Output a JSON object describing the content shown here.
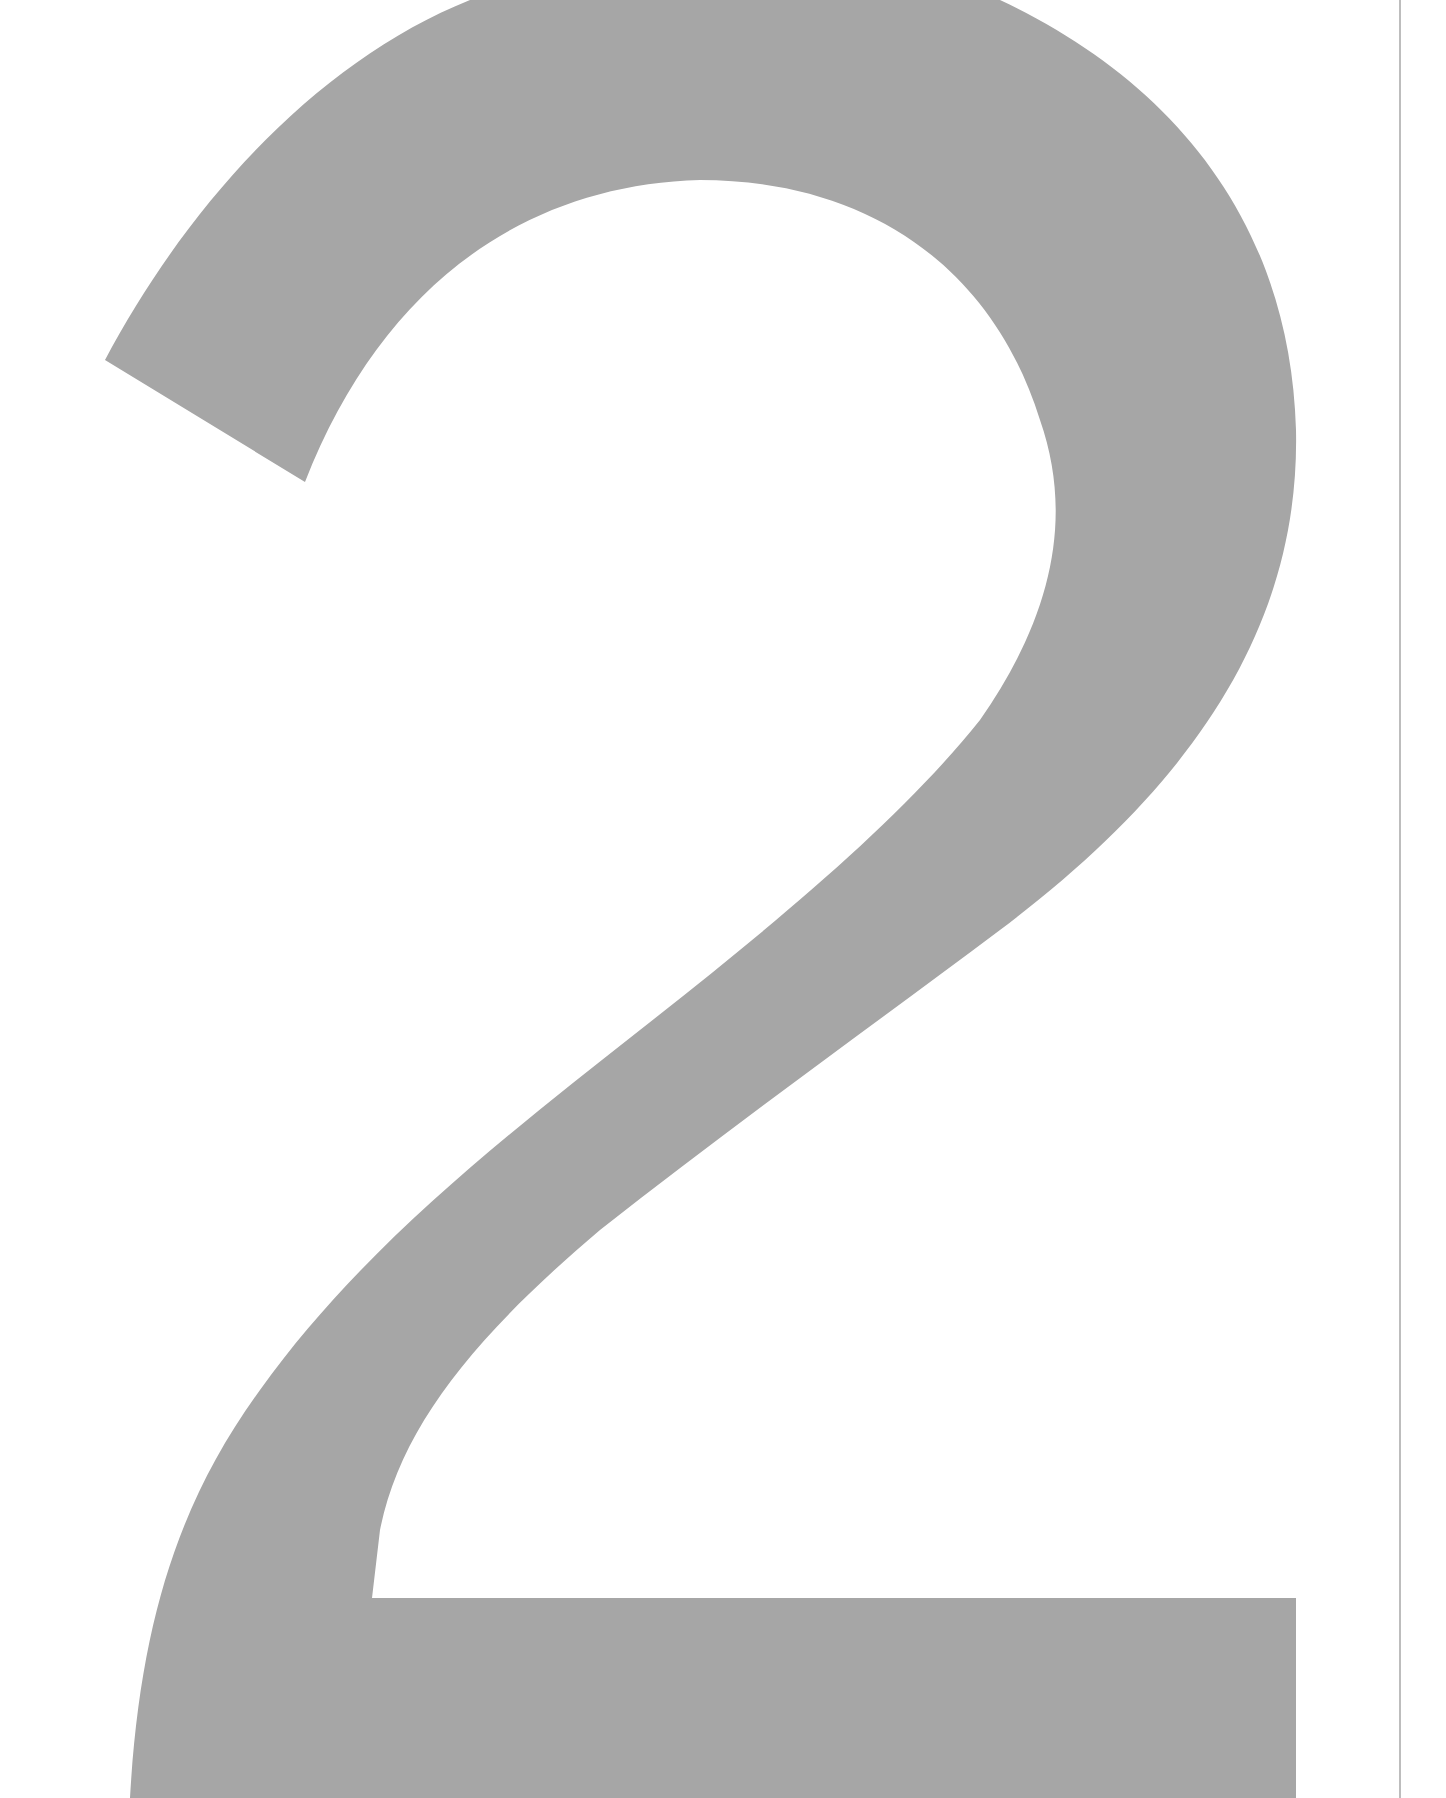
{
  "page": {
    "type": "scanned document page",
    "background_color": "#ffffff"
  },
  "numeral": {
    "text": "2",
    "fill_color": "#a6a6a6",
    "description": "large gray chapter/section numeral"
  },
  "edge_rule": {
    "color": "#bdbdbd"
  }
}
